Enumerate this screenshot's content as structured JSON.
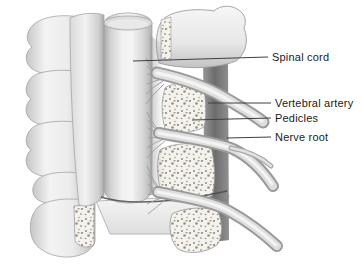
{
  "figure": {
    "labels": [
      {
        "id": "spinal-cord",
        "text": "Spinal cord"
      },
      {
        "id": "vertebral-artery",
        "text": "Vertebral artery"
      },
      {
        "id": "pedicles",
        "text": "Pedicles"
      },
      {
        "id": "nerve-root",
        "text": "Nerve root"
      }
    ],
    "colors": {
      "background": "#ffffff",
      "label_text": "#1b1b1b",
      "leader_line": "#3f3f3f",
      "outline": "#9c9c9c",
      "bone_highlight": "#f2f2f2",
      "bone_shade": "#c2c2c2",
      "cancellous_bone": "#f4f2ec",
      "stipple_dot": "#938c80",
      "artery_groove": "#6d6d6d"
    }
  }
}
